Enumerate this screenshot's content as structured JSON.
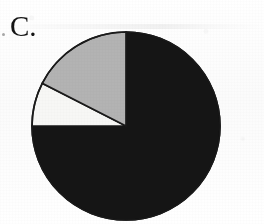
{
  "figure": {
    "panel_label": "C.",
    "background_color": "#fdfdfd"
  },
  "chart_data": {
    "type": "pie",
    "title": "C.",
    "subtitle": "",
    "xlabel": "",
    "ylabel": "",
    "legend_position": "none",
    "grid": false,
    "start_angle_deg_from_north": 0,
    "direction": "clockwise",
    "center_px": [
      126,
      126
    ],
    "radius_px": 94,
    "categories": [
      "Segment 1",
      "Segment 2",
      "Segment 3"
    ],
    "values": [
      75,
      17.5,
      7.5
    ],
    "sweep_degrees": [
      270,
      63,
      27
    ],
    "slices": [
      {
        "label": "Segment 1",
        "value": 75,
        "sweep_deg": 270,
        "start_deg": 0,
        "end_deg": 270,
        "fill": "#151515",
        "stroke": "#0d0d0d"
      },
      {
        "label": "Segment 3",
        "value": 7.5,
        "sweep_deg": 27,
        "start_deg": 270,
        "end_deg": 297,
        "fill": "#f7f7f5",
        "stroke": "#1a1a1a"
      },
      {
        "label": "Segment 2",
        "value": 17.5,
        "sweep_deg": 63,
        "start_deg": 297,
        "end_deg": 360,
        "fill": "#b3b3b3",
        "stroke": "#1a1a1a"
      }
    ],
    "colors": {
      "dark": "#151515",
      "gray": "#b3b3b3",
      "white": "#f7f7f5",
      "outline": "#1a1a1a"
    }
  }
}
